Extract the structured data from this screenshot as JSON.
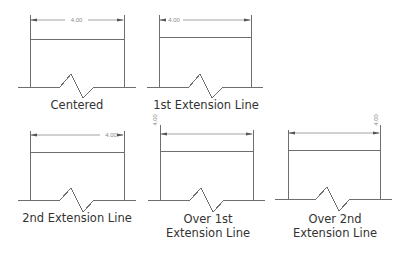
{
  "diagram": {
    "dimension_value": "4.00",
    "line_color": "#6e6e6e",
    "text_color": "#333333",
    "panels": [
      {
        "id": "centered",
        "caption_line1": "Centered",
        "caption_line2": "",
        "text_position": "center",
        "text_orientation": "horizontal"
      },
      {
        "id": "first-extension",
        "caption_line1": "1st Extension Line",
        "caption_line2": "",
        "text_position": "near-first-extension",
        "text_orientation": "horizontal"
      },
      {
        "id": "second-extension",
        "caption_line1": "2nd Extension Line",
        "caption_line2": "",
        "text_position": "near-second-extension",
        "text_orientation": "horizontal"
      },
      {
        "id": "over-first-extension",
        "caption_line1": "Over 1st",
        "caption_line2": "Extension Line",
        "text_position": "over-first-extension",
        "text_orientation": "vertical"
      },
      {
        "id": "over-second-extension",
        "caption_line1": "Over 2nd",
        "caption_line2": "Extension Line",
        "text_position": "over-second-extension",
        "text_orientation": "vertical"
      }
    ]
  }
}
